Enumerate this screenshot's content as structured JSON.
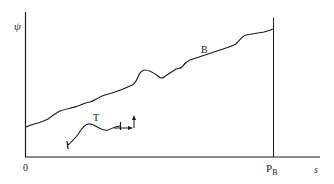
{
  "figure": {
    "y_axis_label": "ψ",
    "x_axis_label": "s",
    "origin_label": "0",
    "marker_label_main": "P",
    "marker_label_sub": "B",
    "curve_label": "B",
    "trajectory_label": "T",
    "line_color": "#1a1a1a",
    "background": "#ffffff"
  }
}
